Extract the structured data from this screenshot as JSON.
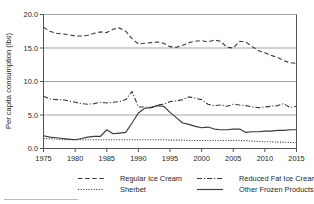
{
  "chart_data": {
    "type": "line",
    "title": "",
    "xlabel": "",
    "ylabel": "Per capita consumption (lbs)",
    "xlim": [
      1975,
      2015
    ],
    "ylim": [
      0.0,
      20.0
    ],
    "grid": "horizontal",
    "legend_position": "bottom",
    "yticks": [
      "0.0",
      "5.0",
      "10.0",
      "15.0",
      "20.0"
    ],
    "ytick_values": [
      0.0,
      5.0,
      10.0,
      15.0,
      20.0
    ],
    "xticks": [
      "1975",
      "1980",
      "1985",
      "1990",
      "1995",
      "2000",
      "2005",
      "2010",
      "2015"
    ],
    "xtick_values": [
      1975,
      1980,
      1985,
      1990,
      1995,
      2000,
      2005,
      2010,
      2015
    ],
    "x": [
      1975,
      1976,
      1977,
      1978,
      1979,
      1980,
      1981,
      1982,
      1983,
      1984,
      1985,
      1986,
      1987,
      1988,
      1989,
      1990,
      1991,
      1992,
      1993,
      1994,
      1995,
      1996,
      1997,
      1998,
      1999,
      2000,
      2001,
      2002,
      2003,
      2004,
      2005,
      2006,
      2007,
      2008,
      2009,
      2010,
      2011,
      2012,
      2013,
      2014,
      2015
    ],
    "series": [
      {
        "name": "Regular Ice Cream",
        "style": "dashed",
        "values": [
          18.1,
          17.5,
          17.2,
          17.1,
          17.0,
          16.8,
          16.8,
          16.9,
          17.2,
          17.4,
          17.3,
          17.8,
          18.0,
          17.5,
          16.4,
          15.6,
          15.7,
          15.8,
          15.9,
          15.7,
          15.2,
          15.1,
          15.4,
          15.8,
          16.0,
          16.1,
          15.9,
          16.2,
          16.0,
          15.1,
          15.0,
          16.0,
          15.9,
          15.2,
          14.6,
          14.3,
          13.9,
          13.6,
          13.1,
          12.8,
          12.7
        ]
      },
      {
        "name": "Reduced Fat Ice Cream",
        "style": "dash-dot",
        "values": [
          7.8,
          7.4,
          7.3,
          7.3,
          7.1,
          6.9,
          6.7,
          6.6,
          6.7,
          6.9,
          6.8,
          6.9,
          7.0,
          7.3,
          8.5,
          6.2,
          6.2,
          6.1,
          6.5,
          6.6,
          7.0,
          7.1,
          7.3,
          7.7,
          7.5,
          7.3,
          6.6,
          6.4,
          6.5,
          6.3,
          6.6,
          6.5,
          6.4,
          6.2,
          6.1,
          6.2,
          6.3,
          6.4,
          6.7,
          6.1,
          6.3
        ]
      },
      {
        "name": "Sherbet",
        "style": "dotted",
        "values": [
          1.5,
          1.45,
          1.4,
          1.35,
          1.3,
          1.3,
          1.3,
          1.3,
          1.3,
          1.3,
          1.3,
          1.3,
          1.3,
          1.3,
          1.3,
          1.3,
          1.3,
          1.3,
          1.3,
          1.3,
          1.25,
          1.25,
          1.25,
          1.2,
          1.2,
          1.2,
          1.2,
          1.2,
          1.2,
          1.2,
          1.2,
          1.2,
          1.15,
          1.1,
          1.05,
          1.0,
          1.0,
          0.95,
          0.95,
          0.9,
          0.9
        ]
      },
      {
        "name": "Other Frozen Products",
        "style": "solid",
        "values": [
          1.9,
          1.7,
          1.6,
          1.5,
          1.4,
          1.3,
          1.5,
          1.7,
          1.8,
          1.8,
          2.8,
          2.2,
          2.3,
          2.4,
          3.8,
          5.3,
          6.0,
          6.1,
          6.4,
          6.3,
          5.4,
          4.6,
          3.8,
          3.6,
          3.3,
          3.1,
          3.2,
          2.9,
          2.8,
          2.8,
          2.9,
          2.9,
          2.4,
          2.5,
          2.5,
          2.6,
          2.6,
          2.7,
          2.7,
          2.8,
          2.8
        ]
      }
    ]
  },
  "legend": {
    "items": [
      {
        "label": "Regular Ice Cream",
        "style": "dashed"
      },
      {
        "label": "Reduced Fat Ice Cream",
        "style": "dash-dot"
      },
      {
        "label": "Sherbet",
        "style": "dotted"
      },
      {
        "label": "Other Frozen Products",
        "style": "solid"
      }
    ]
  }
}
